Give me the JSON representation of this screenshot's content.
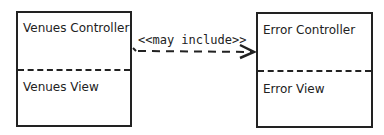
{
  "diagram": {
    "nodes": [
      {
        "id": "venues",
        "controller_label": "Venues Controller",
        "view_label": "Venues View"
      },
      {
        "id": "error",
        "controller_label": "Error Controller",
        "view_label": "Error View"
      }
    ],
    "edges": [
      {
        "from": "venues",
        "to": "error",
        "label": "<<may include>>",
        "style": "dashed",
        "arrowhead": "open"
      }
    ],
    "colors": {
      "stroke": "#222222",
      "background": "#ffffff"
    }
  }
}
